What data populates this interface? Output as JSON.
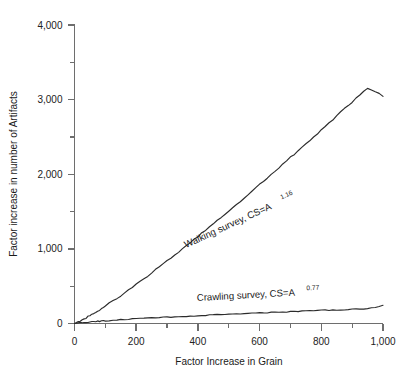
{
  "chart_data": {
    "type": "line",
    "title": "",
    "xlabel": "Factor Increase in Grain",
    "ylabel": "Factor increase in number of Artifacts",
    "xlim": [
      0,
      1000
    ],
    "ylim": [
      0,
      4000
    ],
    "grid": false,
    "legend_position": "inline-annotation",
    "x_ticks": [
      0,
      200,
      400,
      600,
      800,
      1000
    ],
    "x_tick_labels": [
      "0",
      "200",
      "400",
      "600",
      "800",
      "1,000"
    ],
    "x_minor_tick_step": 100,
    "y_ticks": [
      0,
      1000,
      2000,
      3000,
      4000
    ],
    "y_tick_labels": [
      "0",
      "1,000",
      "2,000",
      "3,000",
      "4,000"
    ],
    "y_minor_tick_step": 500,
    "series": [
      {
        "name": "Walking survey",
        "label_text": "Walking survey, CS=A",
        "label_exponent": "1.16",
        "equation": "CS=A^1.16",
        "exponent": 1.16,
        "color": "#2b2b2b",
        "x": [
          0,
          25,
          50,
          75,
          100,
          150,
          200,
          250,
          300,
          350,
          400,
          450,
          500,
          550,
          600,
          650,
          700,
          750,
          800,
          850,
          900,
          950,
          1000
        ],
        "y": [
          0,
          47,
          105,
          168,
          234,
          374,
          522,
          677,
          836,
          1000,
          1167,
          1337,
          1510,
          1685,
          1863,
          2043,
          2225,
          2409,
          2594,
          2781,
          2970,
          3160,
          3050
        ]
      },
      {
        "name": "Crawling survey",
        "label_text": "Crawling survey, CS=A",
        "label_exponent": "0.77",
        "equation": "CS=A^0.77",
        "exponent": 0.77,
        "color": "#2b2b2b",
        "x": [
          0,
          25,
          50,
          75,
          100,
          150,
          200,
          250,
          300,
          350,
          400,
          450,
          500,
          550,
          600,
          650,
          700,
          750,
          800,
          850,
          900,
          950,
          1000
        ],
        "y": [
          0,
          12,
          21,
          29,
          36,
          50,
          62,
          74,
          85,
          95,
          105,
          115,
          124,
          133,
          142,
          150,
          159,
          167,
          175,
          182,
          190,
          197,
          240
        ]
      }
    ]
  }
}
